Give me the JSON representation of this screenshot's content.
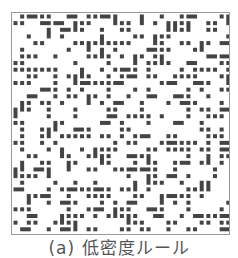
{
  "figure": {
    "caption": "(a) 低密度ルール",
    "pattern": {
      "rows": 33,
      "cols": 33,
      "cell_pitch_px": 6.65,
      "dot_size_px": 4,
      "dot_color": "#444444",
      "border_color": "#9a9a9a",
      "density": 0.42,
      "seed": 20240517
    }
  }
}
